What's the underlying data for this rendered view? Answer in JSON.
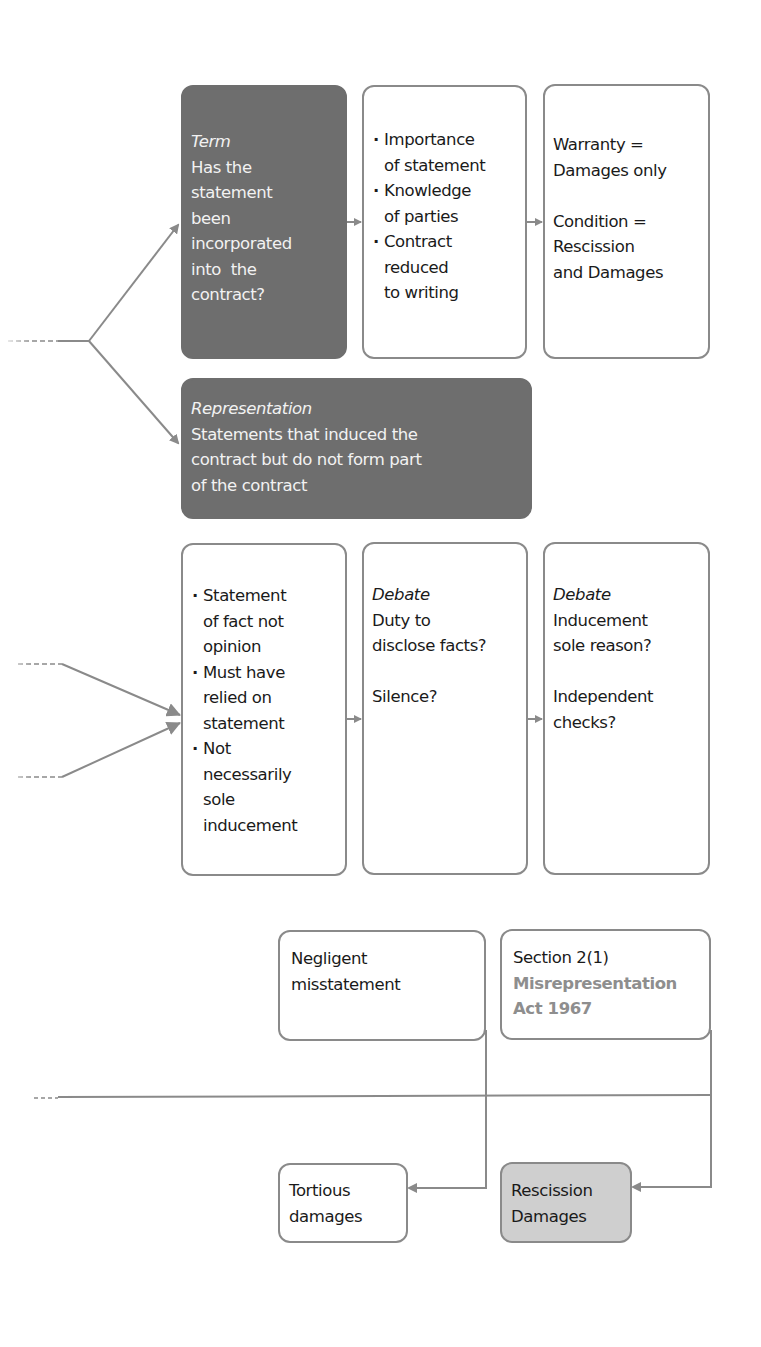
{
  "diagram": {
    "type": "flowchart",
    "colors": {
      "dark_box": "#6e6e6e",
      "border": "#8a8a8a",
      "filled_box": "#cfcfcf",
      "line": "#8a8a8a",
      "accent_text": "#8e8e8e"
    },
    "term_box": {
      "heading": "Term",
      "lines": [
        "Has the",
        "statement",
        "been",
        "incorporated",
        "into  the",
        "contract?"
      ]
    },
    "term_factors_box": {
      "bullets": [
        {
          "first": "Importance",
          "rest": [
            "of statement"
          ]
        },
        {
          "first": "Knowledge",
          "rest": [
            "of parties"
          ]
        },
        {
          "first": "Contract",
          "rest": [
            "reduced",
            "to writing"
          ]
        }
      ]
    },
    "remedies_box": {
      "warranty": [
        "Warranty =",
        "Damages only"
      ],
      "condition": [
        "Condition =",
        "Rescission",
        "and Damages"
      ]
    },
    "representation_box": {
      "heading": "Representation",
      "lines": [
        "Statements that induced the",
        "contract but do not form part",
        "of the contract"
      ]
    },
    "requirements_box": {
      "bullets": [
        {
          "first": "Statement",
          "rest": [
            "of fact not",
            "opinion"
          ]
        },
        {
          "first": "Must have",
          "rest": [
            "relied on",
            "statement"
          ]
        },
        {
          "first": "Not",
          "rest": [
            "necessarily",
            "sole",
            "inducement"
          ]
        }
      ]
    },
    "debate_disclosure_box": {
      "heading": "Debate",
      "lines": [
        "Duty to",
        "disclose facts?"
      ],
      "extra": "Silence?"
    },
    "debate_inducement_box": {
      "heading": "Debate",
      "lines": [
        "Inducement",
        "sole reason?"
      ],
      "extra_lines": [
        "Independent",
        "checks?"
      ]
    },
    "negligent_box": {
      "lines": [
        "Negligent",
        "misstatement"
      ]
    },
    "section_box": {
      "line": "Section 2(1)",
      "accent_lines": [
        "Misrepresentation",
        "Act 1967"
      ]
    },
    "tortious_box": {
      "lines": [
        "Tortious",
        "damages"
      ]
    },
    "rescission_box": {
      "lines": [
        "Rescission",
        "Damages"
      ]
    }
  }
}
